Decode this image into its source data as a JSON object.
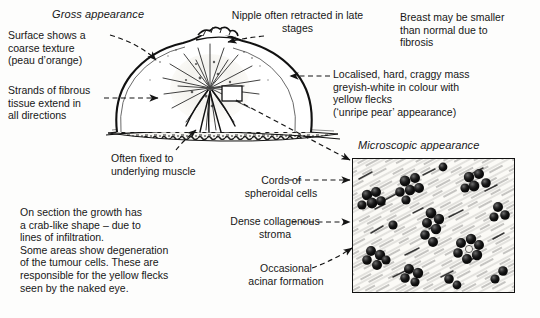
{
  "figure": {
    "sections": {
      "gross_title": "Gross appearance",
      "micro_title": "Microscopic appearance"
    }
  },
  "gross_labels": {
    "surface": "Surface shows a\ncoarse texture\n(peau d’orange)",
    "strands": "Strands of fibrous\ntissue extend in\nall directions",
    "nipple": "Nipple often retracted in late\nstages",
    "smaller": "Breast may be smaller\nthan normal due to\nfibrosis",
    "mass": "Localised, hard, craggy mass\ngreyish-white in colour with\nyellow flecks\n(‘unripe pear’ appearance)",
    "fixed": "Often fixed to\nunderlying muscle"
  },
  "micro_labels": {
    "cords": "Cords of\nspheroidal cells",
    "stroma": "Dense collagenous\nstroma",
    "acinar": "Occasional\nacinar formation"
  },
  "notes": {
    "section_note": "On section the growth has\na crab-like shape – due to\nlines of infiltration.\nSome areas show degeneration\nof the tumour cells. These are\nresponsible for the yellow flecks\nseen by the naked eye."
  },
  "icons": {
    "breast_profile": "breast-cross-section-illustration",
    "muscle_layer": "hatched-muscle-layer",
    "sample_box": "sample-region-box",
    "histology": "histology-field-illustration"
  },
  "colors": {
    "ink": "#171717",
    "paper": "#fdfdfc",
    "line": "#111111"
  }
}
